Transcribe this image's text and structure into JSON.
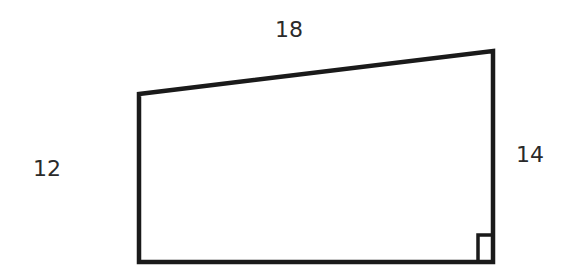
{
  "diagram": {
    "type": "right trapezoid",
    "stroke_color": "#1a1a1a",
    "text_color": "#2a2a2a",
    "labels": {
      "top": "18",
      "left": "12",
      "right": "14"
    },
    "right_angle_marker": "bottom-right"
  }
}
